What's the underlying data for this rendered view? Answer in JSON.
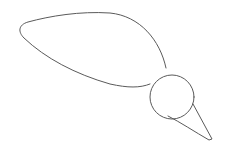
{
  "drawing": {
    "subject": "sketch",
    "stroke_color": "#5a5a5a",
    "background": "#ffffff",
    "parts": [
      "leaf-shape",
      "circle",
      "cone"
    ]
  }
}
